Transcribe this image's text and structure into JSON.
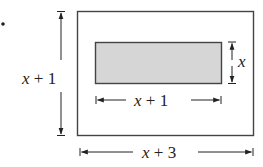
{
  "figure": {
    "bullet": "•",
    "outer_rect": {
      "height_label": "x + 1",
      "width_label": "x + 3",
      "border_color": "#444444",
      "fill": "#ffffff"
    },
    "inner_rect": {
      "height_label": "x",
      "width_label": "x + 1",
      "border_color": "#444444",
      "fill": "#d6d6d6"
    },
    "labels": {
      "outer_height": {
        "var": "x",
        "rest": " + 1"
      },
      "outer_width": {
        "var": "x",
        "rest": " + 3"
      },
      "inner_height": {
        "var": "x",
        "rest": ""
      },
      "inner_width": {
        "var": "x",
        "rest": " + 1"
      }
    }
  }
}
